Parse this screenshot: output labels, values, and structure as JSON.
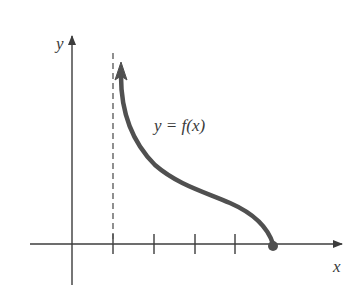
{
  "figure": {
    "axes": {
      "x_label": "x",
      "y_label": "y"
    },
    "curve_label": "y = f(x)",
    "colors": {
      "axes": "#3c3c3c",
      "curve": "#505050",
      "dashed": "#555555"
    },
    "x_axis_ticks_count": 4,
    "asymptote": "vertical dashed line at first tick",
    "endpoint": "filled dot on x-axis"
  }
}
